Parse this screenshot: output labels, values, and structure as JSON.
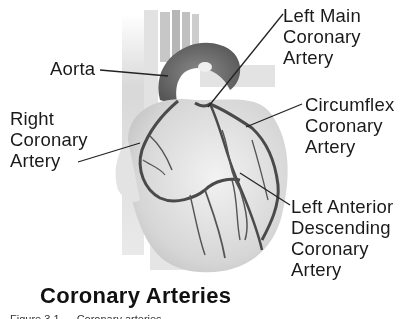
{
  "diagram": {
    "title": "Coronary Arteries",
    "caption": "Figure 3.1 — Coronary arteries",
    "colors": {
      "background": "#ffffff",
      "text": "#1a1a1a",
      "artery": "#4a4a4a",
      "heart_fill": "#d9d9d9",
      "aorta": "#6e6e6e",
      "leader_line": "#222222"
    },
    "labels": {
      "aorta": {
        "lines": [
          "Aorta"
        ]
      },
      "right_coronary_artery": {
        "lines": [
          "Right",
          "Coronary",
          "Artery"
        ]
      },
      "left_main_coronary_artery": {
        "lines": [
          "Left Main",
          "Coronary",
          "Artery"
        ]
      },
      "circumflex_coronary_artery": {
        "lines": [
          "Circumflex",
          "Coronary",
          "Artery"
        ]
      },
      "left_anterior_descending_coronary_artery": {
        "lines": [
          "Left Anterior",
          "Descending",
          "Coronary",
          "Artery"
        ]
      }
    }
  }
}
